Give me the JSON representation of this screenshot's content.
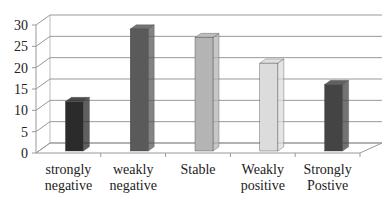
{
  "chart_data": {
    "type": "bar",
    "style": "3d-column",
    "title": "",
    "xlabel": "",
    "ylabel": "",
    "categories": [
      "strongly negative",
      "weakly negative",
      "Stable",
      "Weakly positive",
      "Strongly Postive"
    ],
    "category_lines": [
      [
        "strongly",
        "negative"
      ],
      [
        "weakly",
        "negative"
      ],
      [
        "Stable"
      ],
      [
        "Weakly",
        "positive"
      ],
      [
        "Strongly",
        "Postive"
      ]
    ],
    "values": [
      11,
      28,
      26,
      20,
      15
    ],
    "bar_colors": [
      "#2b2b2b",
      "#5a5a5a",
      "#b4b4b4",
      "#dcdcdc",
      "#444444"
    ],
    "yticks": [
      0,
      5,
      10,
      15,
      20,
      25,
      30
    ],
    "ytick_labels": [
      "0",
      "5",
      "10",
      "15",
      "20",
      "25",
      "30"
    ],
    "ylim": [
      0,
      30
    ],
    "grid": true,
    "legend": "none"
  }
}
